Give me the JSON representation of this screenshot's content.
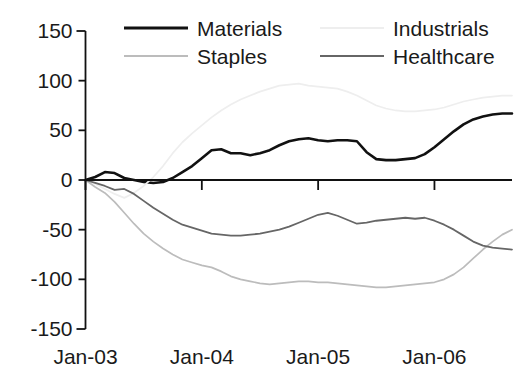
{
  "chart_data": {
    "type": "line",
    "title": "",
    "subtitle": "",
    "xlabel": "",
    "ylabel": "",
    "grid": false,
    "legend_position": "top",
    "xlim": [
      0,
      44
    ],
    "ylim": [
      -150,
      150
    ],
    "y_ticks": [
      150,
      100,
      50,
      0,
      -50,
      -100,
      -150
    ],
    "y_tick_labels": [
      "150",
      "100",
      "50",
      "0",
      "-50",
      "-100",
      "-150"
    ],
    "x_ticks": [
      0,
      12,
      24,
      36
    ],
    "x_tick_labels": [
      "Jan-03",
      "Jan-04",
      "Jan-05",
      "Jan-06"
    ],
    "x_unit": "months since Jan-03",
    "series": [
      {
        "name": "Materials",
        "color": "#111111",
        "width": 2.6,
        "values": [
          0,
          3,
          8,
          7,
          2,
          0,
          -2,
          -3,
          -2,
          2,
          8,
          14,
          22,
          30,
          31,
          27,
          27,
          25,
          27,
          30,
          35,
          39,
          41,
          42,
          40,
          39,
          40,
          40,
          39,
          28,
          21,
          20,
          20,
          21,
          22,
          26,
          33,
          41,
          49,
          56,
          61,
          64,
          66,
          67,
          67
        ]
      },
      {
        "name": "Industrials",
        "color": "#eeeeee",
        "width": 1.7,
        "values": [
          0,
          -4,
          -9,
          -14,
          -18,
          -13,
          -6,
          3,
          14,
          27,
          38,
          47,
          55,
          63,
          70,
          76,
          81,
          85,
          89,
          92,
          95,
          96,
          97,
          95,
          94,
          93,
          92,
          89,
          85,
          80,
          75,
          72,
          70,
          69,
          69,
          70,
          71,
          73,
          76,
          79,
          81,
          83,
          84,
          85,
          85
        ]
      },
      {
        "name": "Staples",
        "color": "#bcbcbc",
        "width": 1.7,
        "values": [
          0,
          -7,
          -13,
          -22,
          -33,
          -44,
          -54,
          -62,
          -69,
          -75,
          -80,
          -83,
          -86,
          -88,
          -92,
          -97,
          -100,
          -102,
          -104,
          -105,
          -104,
          -103,
          -102,
          -102,
          -103,
          -103,
          -104,
          -105,
          -106,
          -107,
          -108,
          -108,
          -107,
          -106,
          -105,
          -104,
          -103,
          -100,
          -95,
          -88,
          -79,
          -70,
          -62,
          -55,
          -50
        ]
      },
      {
        "name": "Healthcare",
        "color": "#666666",
        "width": 1.8,
        "values": [
          0,
          -3,
          -6,
          -10,
          -9,
          -14,
          -21,
          -28,
          -34,
          -40,
          -45,
          -48,
          -51,
          -54,
          -55,
          -56,
          -56,
          -55,
          -54,
          -52,
          -50,
          -47,
          -43,
          -39,
          -35,
          -33,
          -36,
          -40,
          -44,
          -43,
          -41,
          -40,
          -39,
          -38,
          -39,
          -38,
          -41,
          -45,
          -50,
          -56,
          -62,
          -66,
          -68,
          -69,
          -70
        ]
      }
    ]
  },
  "legend": {
    "rows": [
      [
        {
          "label": "Materials",
          "swatch": "line-swatch-materials"
        },
        {
          "label": "Industrials",
          "swatch": "line-swatch-industrials"
        }
      ],
      [
        {
          "label": "Staples",
          "swatch": "line-swatch-staples"
        },
        {
          "label": "Healthcare",
          "swatch": "line-swatch-healthcare"
        }
      ]
    ]
  },
  "axes": {
    "y_labels": [
      "150",
      "100",
      "50",
      "0",
      "-50",
      "-100",
      "-150"
    ],
    "x_labels": [
      "Jan-03",
      "Jan-04",
      "Jan-05",
      "Jan-06"
    ],
    "axis_color": "#111111"
  }
}
